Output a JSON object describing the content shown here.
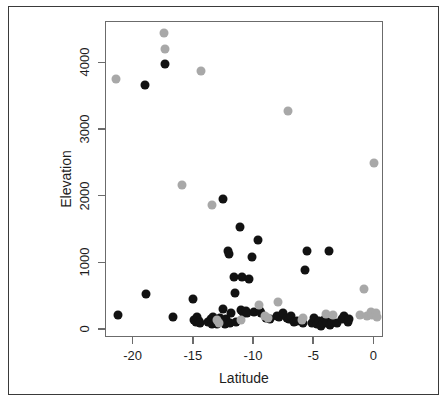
{
  "chart_data": {
    "type": "scatter",
    "title": "",
    "xlabel": "Latitude",
    "ylabel": "Elevation",
    "xlim": [
      -22.3,
      0.8
    ],
    "ylim": [
      -120,
      4620
    ],
    "xticks": [
      -20,
      -15,
      -10,
      -5,
      0
    ],
    "xtick_labels": [
      "-20",
      "-15",
      "-10",
      "-5",
      "0"
    ],
    "yticks": [
      0,
      1000,
      2000,
      3000,
      4000
    ],
    "ytick_labels": [
      "0",
      "1000",
      "2000",
      "3000",
      "4000"
    ],
    "grid": false,
    "legend": "none",
    "point_size_px": 9,
    "series": [
      {
        "name": "black",
        "color": "#121212",
        "points": [
          [
            -21.3,
            225
          ],
          [
            -19.1,
            3680
          ],
          [
            -19.0,
            540
          ],
          [
            -17.4,
            3990
          ],
          [
            -16.7,
            195
          ],
          [
            -15.1,
            460
          ],
          [
            -15.0,
            155
          ],
          [
            -14.8,
            115
          ],
          [
            -14.7,
            190
          ],
          [
            -14.6,
            135
          ],
          [
            -14.5,
            105
          ],
          [
            -13.8,
            120
          ],
          [
            -13.6,
            160
          ],
          [
            -13.5,
            95
          ],
          [
            -13.4,
            200
          ],
          [
            -13.3,
            110
          ],
          [
            -13.1,
            90
          ],
          [
            -13.0,
            140
          ],
          [
            -12.8,
            175
          ],
          [
            -12.6,
            1970
          ],
          [
            -12.6,
            310
          ],
          [
            -12.5,
            130
          ],
          [
            -12.4,
            95
          ],
          [
            -12.3,
            160
          ],
          [
            -12.2,
            1180
          ],
          [
            -12.1,
            1140
          ],
          [
            -12.0,
            105
          ],
          [
            -11.9,
            255
          ],
          [
            -11.7,
            800
          ],
          [
            -11.6,
            560
          ],
          [
            -11.5,
            120
          ],
          [
            -11.2,
            1540
          ],
          [
            -11.1,
            300
          ],
          [
            -11.0,
            800
          ],
          [
            -10.9,
            270
          ],
          [
            -10.8,
            255
          ],
          [
            -10.7,
            290
          ],
          [
            -10.6,
            250
          ],
          [
            -10.4,
            770
          ],
          [
            -10.2,
            1090
          ],
          [
            -10.0,
            275
          ],
          [
            -9.7,
            1350
          ],
          [
            -9.5,
            280
          ],
          [
            -9.4,
            250
          ],
          [
            -9.0,
            180
          ],
          [
            -8.7,
            160
          ],
          [
            -8.1,
            215
          ],
          [
            -7.9,
            200
          ],
          [
            -7.6,
            255
          ],
          [
            -7.3,
            175
          ],
          [
            -7.1,
            160
          ],
          [
            -6.9,
            210
          ],
          [
            -6.7,
            120
          ],
          [
            -6.4,
            140
          ],
          [
            -5.9,
            110
          ],
          [
            -5.8,
            900
          ],
          [
            -5.6,
            1180
          ],
          [
            -5.2,
            100
          ],
          [
            -5.0,
            175
          ],
          [
            -4.8,
            85
          ],
          [
            -4.6,
            130
          ],
          [
            -4.4,
            60
          ],
          [
            -4.3,
            110
          ],
          [
            -4.1,
            170
          ],
          [
            -3.9,
            100
          ],
          [
            -3.8,
            1190
          ],
          [
            -3.7,
            70
          ],
          [
            -3.5,
            120
          ],
          [
            -3.1,
            105
          ],
          [
            -2.7,
            165
          ],
          [
            -2.5,
            215
          ],
          [
            -2.2,
            120
          ],
          [
            -2.1,
            165
          ]
        ]
      },
      {
        "name": "gray",
        "color": "#a8a8a8",
        "points": [
          [
            -21.5,
            3760
          ],
          [
            -17.5,
            4450
          ],
          [
            -17.4,
            4210
          ],
          [
            -16.0,
            2180
          ],
          [
            -14.4,
            3890
          ],
          [
            -13.5,
            1880
          ],
          [
            -13.1,
            155
          ],
          [
            -12.9,
            110
          ],
          [
            -11.1,
            145
          ],
          [
            -9.6,
            370
          ],
          [
            -9.1,
            205
          ],
          [
            -8.8,
            185
          ],
          [
            -8.0,
            420
          ],
          [
            -7.2,
            3280
          ],
          [
            -6.0,
            150
          ],
          [
            -5.9,
            175
          ],
          [
            -4.0,
            245
          ],
          [
            -3.4,
            230
          ],
          [
            -1.2,
            230
          ],
          [
            -0.9,
            620
          ],
          [
            -0.6,
            210
          ],
          [
            -0.3,
            265
          ],
          [
            -0.2,
            225
          ],
          [
            0.0,
            2500
          ],
          [
            0.1,
            255
          ],
          [
            0.2,
            200
          ]
        ]
      }
    ]
  },
  "axis_titles": {
    "y": "Elevation",
    "x": "Latitude"
  }
}
